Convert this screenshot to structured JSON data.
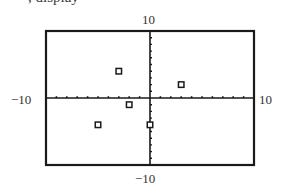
{
  "header": {
    "clipped_text": ", display"
  },
  "axes": {
    "ymax_label": "10",
    "ymin_label": "−10",
    "xmin_label": "−10",
    "xmax_label": "10"
  },
  "chart_data": {
    "type": "scatter",
    "title": "",
    "xlabel": "",
    "ylabel": "",
    "xlim": [
      -10,
      10
    ],
    "ylim": [
      -10,
      10
    ],
    "xscale_ticks": 1,
    "yscale_ticks": 1,
    "grid": false,
    "legend": null,
    "tick_labels": {
      "x": [
        "−10",
        "10"
      ],
      "y": [
        "−10",
        "10"
      ]
    },
    "points": [
      {
        "x": -3,
        "y": 4
      },
      {
        "x": 3,
        "y": 2
      },
      {
        "x": -2,
        "y": -1
      },
      {
        "x": -5,
        "y": -4
      },
      {
        "x": 0,
        "y": -4
      }
    ],
    "marker": "hollow-square",
    "colors": {
      "frame": "#1a1a1a",
      "axes": "#1a1a1a",
      "marker": "#1a1a1a",
      "background": "#ffffff"
    }
  }
}
